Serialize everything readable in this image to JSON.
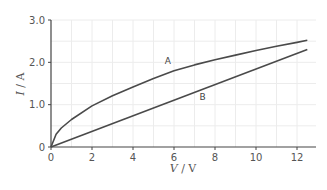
{
  "chart_data": {
    "type": "line",
    "title": "",
    "xlabel": "V / V",
    "ylabel": "I / A",
    "xlim": [
      0,
      13
    ],
    "ylim": [
      0,
      3.0
    ],
    "x_ticks": [
      0,
      2,
      4,
      6,
      8,
      10,
      12
    ],
    "x_tick_labels": [
      "0",
      "2",
      "4",
      "6",
      "8",
      "10",
      "12"
    ],
    "y_ticks": [
      0,
      1.0,
      2.0,
      3.0
    ],
    "y_tick_labels": [
      "0",
      "1.0",
      "2.0",
      "3.0"
    ],
    "grid": true,
    "legend": "none (curves labelled directly)",
    "series": [
      {
        "name": "A",
        "x": [
          0,
          0.25,
          0.5,
          1,
          2,
          3,
          4,
          5,
          6,
          7,
          8,
          9,
          10,
          11,
          12,
          12.5
        ],
        "values": [
          0,
          0.3,
          0.45,
          0.65,
          0.97,
          1.21,
          1.42,
          1.62,
          1.8,
          1.94,
          2.06,
          2.17,
          2.28,
          2.38,
          2.47,
          2.52
        ],
        "label_position": [
          5.7,
          1.95
        ]
      },
      {
        "name": "B",
        "x": [
          0,
          12.5
        ],
        "values": [
          0,
          2.3
        ],
        "label_position": [
          7.4,
          1.1
        ]
      }
    ]
  },
  "axes": {
    "x_label_main": "V",
    "x_label_unit": " / V",
    "y_label_main": "I",
    "y_label_unit": " / A"
  }
}
